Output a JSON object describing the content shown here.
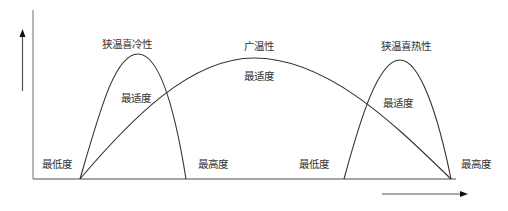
{
  "diagram": {
    "type": "temperature-tolerance-curves",
    "axes": {
      "y_arrow": "up",
      "x_arrow": "right",
      "line_color": "#888888",
      "curve_color": "#333333"
    },
    "curves": [
      {
        "name": "狭温喜冷性",
        "optimum_label": "最适度",
        "min_label": "最低度",
        "max_label": "最高度"
      },
      {
        "name": "广温性",
        "optimum_label": "最适度"
      },
      {
        "name": "狭温喜热性",
        "optimum_label": "最适度",
        "min_label": "最低度",
        "max_label": "最高度"
      }
    ]
  }
}
